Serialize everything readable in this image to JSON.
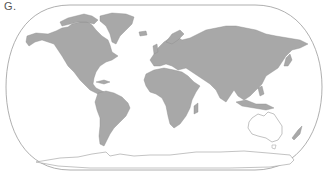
{
  "figure": {
    "label": "G.",
    "projection": "world-map-rounded-frame",
    "highlighted_region": "Australia",
    "colors": {
      "land": "#a8a8a8",
      "land_stroke": "#8a8a8a",
      "highlight_fill": "#ffffff",
      "highlight_stroke": "#999999",
      "frame_stroke": "#999999",
      "background": "#ffffff"
    },
    "regions": [
      {
        "name": "North America",
        "style": "land"
      },
      {
        "name": "Greenland",
        "style": "land"
      },
      {
        "name": "South America",
        "style": "land"
      },
      {
        "name": "Europe",
        "style": "land"
      },
      {
        "name": "Asia",
        "style": "land"
      },
      {
        "name": "Africa",
        "style": "land"
      },
      {
        "name": "Madagascar",
        "style": "land"
      },
      {
        "name": "Australia",
        "style": "highlight"
      },
      {
        "name": "New Zealand",
        "style": "land"
      },
      {
        "name": "Antarctica",
        "style": "outline"
      }
    ]
  }
}
